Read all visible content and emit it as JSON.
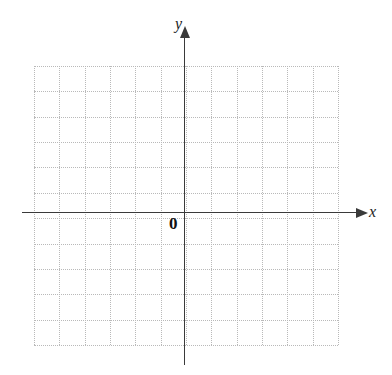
{
  "figure": {
    "kind": "cartesian-coordinate-grid",
    "width": 392,
    "height": 375,
    "background_color": "#ffffff"
  },
  "labels": {
    "x_axis": "x",
    "y_axis": "y",
    "origin": "0"
  },
  "chart_data": {
    "type": "scatter",
    "title": "",
    "subtitle": "",
    "xlabel": "x",
    "ylabel": "y",
    "origin_label": "0",
    "series": [
      {
        "name": "",
        "x": [],
        "y": []
      }
    ],
    "x": [],
    "values": [],
    "categories": [],
    "xlim": [
      -6,
      6
    ],
    "ylim": [
      -5.5,
      5.5
    ],
    "xticks": [],
    "yticks": [],
    "xticklabels": [],
    "yticklabels": [],
    "grid": true,
    "grid_style": "dotted",
    "grid_color": "#b9b9b9",
    "grid_cell_px": 25.4,
    "grid_columns": 12,
    "grid_rows": 11,
    "origin_column_index": 6,
    "origin_row_index": 6,
    "axis_color": "#3a3a3a",
    "axis_arrows": [
      "x-positive",
      "y-positive"
    ],
    "legend": [],
    "legend_position": "none",
    "annotations": []
  },
  "geometry": {
    "grid_left": 34,
    "grid_top": 66,
    "grid_right": 338,
    "grid_bottom": 345,
    "origin_x": 184,
    "origin_y": 212,
    "x_axis_start": 22,
    "x_axis_end": 356,
    "y_axis_top": 38,
    "y_axis_bottom": 365,
    "x_label_pos": [
      369,
      204
    ],
    "y_label_pos": [
      175,
      16
    ],
    "origin_label_pos": [
      169,
      215
    ]
  }
}
